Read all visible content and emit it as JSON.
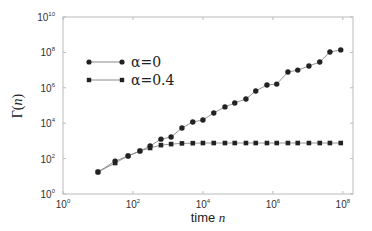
{
  "chart_data": {
    "type": "line",
    "title": "",
    "xlabel": "time n",
    "xlabel_text": "time ",
    "xlabel_var": "n",
    "ylabel": "Γ(n)",
    "ylabel_text": "Γ(",
    "ylabel_var": "n",
    "ylabel_close": ")",
    "xscale": "log",
    "yscale": "log",
    "xlim": [
      1,
      100000000
    ],
    "ylim": [
      1,
      10000000000
    ],
    "x_ticks": [
      {
        "base": "10",
        "exp": "0",
        "log": 0
      },
      {
        "base": "10",
        "exp": "2",
        "log": 2
      },
      {
        "base": "10",
        "exp": "4",
        "log": 4
      },
      {
        "base": "10",
        "exp": "6",
        "log": 6
      },
      {
        "base": "10",
        "exp": "8",
        "log": 8
      }
    ],
    "y_ticks": [
      {
        "base": "10",
        "exp": "0",
        "log": 0
      },
      {
        "base": "10",
        "exp": "2",
        "log": 2
      },
      {
        "base": "10",
        "exp": "4",
        "log": 4
      },
      {
        "base": "10",
        "exp": "6",
        "log": 6
      },
      {
        "base": "10",
        "exp": "8",
        "log": 8
      },
      {
        "base": "10",
        "exp": "10",
        "log": 10
      }
    ],
    "grid": false,
    "legend_position": "upper left",
    "series": [
      {
        "name": "α=0",
        "marker": "circle",
        "color": "#222222",
        "log_x": [
          1.0,
          1.49,
          1.86,
          2.2,
          2.49,
          2.8,
          3.09,
          3.4,
          3.71,
          4.0,
          4.31,
          4.63,
          4.91,
          5.23,
          5.51,
          5.83,
          6.11,
          6.43,
          6.71,
          7.03,
          7.34,
          7.63,
          7.94
        ],
        "log_y": [
          1.24,
          1.86,
          2.15,
          2.43,
          2.71,
          3.1,
          3.22,
          3.73,
          4.07,
          4.18,
          4.58,
          4.92,
          5.14,
          5.37,
          5.82,
          6.16,
          6.21,
          6.89,
          7.0,
          7.23,
          7.46,
          8.02,
          8.14
        ]
      },
      {
        "name": "α=0.4",
        "marker": "square",
        "color": "#222222",
        "log_x": [
          1.0,
          1.49,
          1.86,
          2.2,
          2.49,
          2.8,
          3.09,
          3.4,
          3.71,
          4.0,
          4.31,
          4.63,
          4.91,
          5.23,
          5.51,
          5.83,
          6.11,
          6.43,
          6.71,
          7.03,
          7.34,
          7.63,
          7.94
        ],
        "log_y": [
          1.24,
          1.75,
          2.15,
          2.43,
          2.6,
          2.76,
          2.82,
          2.86,
          2.87,
          2.88,
          2.88,
          2.88,
          2.88,
          2.88,
          2.88,
          2.88,
          2.88,
          2.88,
          2.88,
          2.88,
          2.88,
          2.88,
          2.88
        ]
      }
    ]
  },
  "layout": {
    "plot": {
      "left": 63,
      "top": 17,
      "right": 353,
      "bottom": 194
    },
    "x_log_min": 0,
    "x_log_max": 8.29,
    "y_log_min": 0,
    "y_log_max": 10,
    "axis_color": "#bbbbbb",
    "line_color": "#888888",
    "marker_color": "#222222"
  }
}
